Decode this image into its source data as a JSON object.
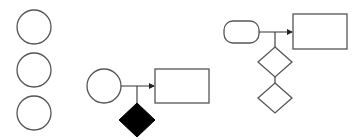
{
  "diagram": {
    "background": "#ffffff",
    "stroke_color": "#555555",
    "line_color": "#333333",
    "fill_dark": "#000000",
    "groups": [
      {
        "name": "standalone-circles",
        "shapes": [
          {
            "type": "circle",
            "cx": 34,
            "cy": 27,
            "r": 17
          },
          {
            "type": "circle",
            "cx": 34,
            "cy": 70,
            "r": 17
          },
          {
            "type": "circle",
            "cx": 34,
            "cy": 113,
            "r": 17
          }
        ]
      },
      {
        "name": "circle-to-rectangle-with-filled-diamond",
        "shapes": [
          {
            "type": "circle",
            "cx": 104,
            "cy": 86,
            "r": 17
          },
          {
            "type": "rect",
            "x": 155,
            "y": 69,
            "w": 54,
            "h": 34
          },
          {
            "type": "diamond",
            "cx": 137,
            "cy": 120,
            "hw": 18,
            "hh": 17,
            "filled": true
          }
        ]
      },
      {
        "name": "pill-to-rectangle-with-two-diamonds",
        "shapes": [
          {
            "type": "rounded-rect",
            "x": 224,
            "y": 21,
            "w": 35,
            "h": 22,
            "rx": 9
          },
          {
            "type": "rect",
            "x": 293,
            "y": 14,
            "w": 54,
            "h": 35
          },
          {
            "type": "diamond",
            "cx": 275,
            "cy": 62,
            "hw": 17,
            "hh": 15,
            "filled": false
          },
          {
            "type": "diamond",
            "cx": 275,
            "cy": 98,
            "hw": 17,
            "hh": 15,
            "filled": false
          }
        ]
      }
    ]
  }
}
